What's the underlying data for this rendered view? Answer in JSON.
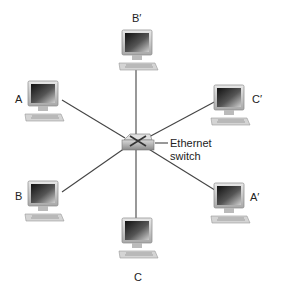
{
  "diagram": {
    "switch": {
      "label_line1": "Ethernet",
      "label_line2": "switch"
    },
    "hosts": [
      {
        "id": "B_prime",
        "label": "B′"
      },
      {
        "id": "A",
        "label": "A"
      },
      {
        "id": "C_prime",
        "label": "C′"
      },
      {
        "id": "B",
        "label": "B"
      },
      {
        "id": "A_prime",
        "label": "A′"
      },
      {
        "id": "C",
        "label": "C"
      }
    ]
  }
}
